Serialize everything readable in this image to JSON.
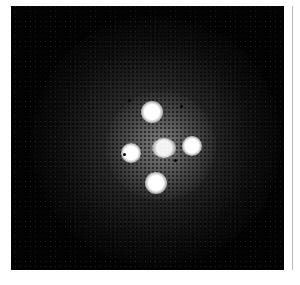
{
  "image": {
    "subject": "quadruply lensed quasar (Einstein cross)",
    "background_color": "#030303",
    "frame": {
      "x": 11,
      "y": 6,
      "width": 273,
      "height": 264
    },
    "sources": [
      {
        "name": "image-top",
        "x": 152,
        "y": 112,
        "diameter": 22
      },
      {
        "name": "image-left",
        "x": 131,
        "y": 153,
        "diameter": 20
      },
      {
        "name": "lens-galaxy-center",
        "x": 164,
        "y": 148,
        "diameter": 24
      },
      {
        "name": "image-right",
        "x": 192,
        "y": 146,
        "diameter": 20
      },
      {
        "name": "image-bottom",
        "x": 156,
        "y": 183,
        "diameter": 22
      }
    ]
  }
}
